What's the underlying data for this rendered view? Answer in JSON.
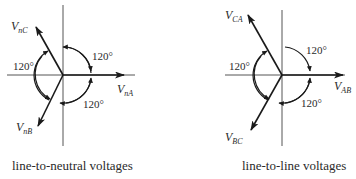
{
  "diagrams": [
    {
      "caption": "line-to-neutral voltages",
      "phasors": [
        {
          "name": "V",
          "sub": "nA",
          "angle_deg": 0
        },
        {
          "name": "V",
          "sub": "nB",
          "angle_deg": -120
        },
        {
          "name": "V",
          "sub": "nC",
          "angle_deg": 120
        }
      ],
      "angle_labels": [
        "120°",
        "120°",
        "120°"
      ]
    },
    {
      "caption": "line-to-line voltages",
      "phasors": [
        {
          "name": "V",
          "sub": "AB",
          "angle_deg": 0
        },
        {
          "name": "V",
          "sub": "BC",
          "angle_deg": -120
        },
        {
          "name": "V",
          "sub": "CA",
          "angle_deg": 120
        }
      ],
      "angle_labels": [
        "120°",
        "120°",
        "120°"
      ]
    }
  ],
  "colors": {
    "ink": "#2a2a2a",
    "axis": "#555555",
    "background": "#ffffff"
  }
}
